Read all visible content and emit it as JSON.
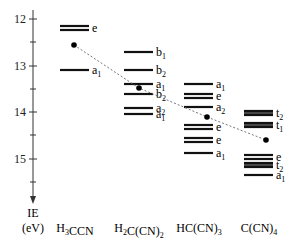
{
  "axis": {
    "label_line1": "IE",
    "label_line2": "(eV)",
    "ticks": [
      "12",
      "13",
      "14",
      "15"
    ],
    "tick_y": {
      "12": 19,
      "13": 66,
      "14": 112,
      "15": 159
    }
  },
  "molecules": [
    {
      "name": "H3CCN",
      "html": "H<sub>3</sub>CCN",
      "x": 90,
      "levels": [
        {
          "y": 28,
          "label": "e",
          "double": true
        },
        {
          "y": 70,
          "label": "a1",
          "double": false
        }
      ],
      "average_y": 45
    },
    {
      "name": "H2C(CN)2",
      "html": "H<sub>2</sub>C(CN)<sub>2</sub>",
      "x": 154,
      "levels": [
        {
          "y": 52,
          "label": "b1"
        },
        {
          "y": 70,
          "label": "b2"
        },
        {
          "y": 84,
          "label": "a1"
        },
        {
          "y": 94,
          "label": "b2"
        },
        {
          "y": 108,
          "label": "a2"
        },
        {
          "y": 114,
          "label": "a1"
        }
      ],
      "average_y": 88
    },
    {
      "name": "HC(CN)3",
      "html": "HC(CN)<sub>3</sub>",
      "x": 214,
      "levels": [
        {
          "y": 84,
          "label": "a1"
        },
        {
          "y": 96,
          "label": "e"
        },
        {
          "y": 107,
          "label": "a2"
        },
        {
          "y": 127,
          "label": "e"
        },
        {
          "y": 140,
          "label": "e"
        },
        {
          "y": 153,
          "label": "a1"
        }
      ],
      "average_y": 117
    },
    {
      "name": "C(CN)4",
      "html": "C(CN)<sub>4</sub>",
      "x": 274,
      "levels": [
        {
          "y": 113,
          "label": "t2"
        },
        {
          "y": 125,
          "label": "t1"
        },
        {
          "y": 157,
          "label": "e"
        },
        {
          "y": 165,
          "label": "t2"
        },
        {
          "y": 175,
          "label": "a1"
        }
      ],
      "average_y": 140
    }
  ],
  "trend_line": {
    "style": "dotted",
    "points": [
      [
        74,
        45
      ],
      [
        139,
        88
      ],
      [
        207,
        117
      ],
      [
        266,
        140
      ]
    ]
  },
  "colors": {
    "bars": "#111111",
    "trend": "#777777",
    "axis": "#333333"
  }
}
